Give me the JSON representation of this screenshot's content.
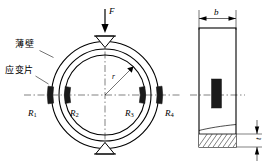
{
  "figure": {
    "stroke_color": "#000000",
    "fill_color": "#1a1a1a",
    "background": "#ffffff"
  },
  "front_view": {
    "force_label": "F",
    "radius_label": "r",
    "thin_wall_label": "薄壁",
    "strain_gauge_label": "应变片",
    "gauges": [
      {
        "id": "R1",
        "label": "R",
        "subscript": "1",
        "position": "outer-left"
      },
      {
        "id": "R2",
        "label": "R",
        "subscript": "2",
        "position": "inner-left"
      },
      {
        "id": "R3",
        "label": "R",
        "subscript": "3",
        "position": "inner-right"
      },
      {
        "id": "R4",
        "label": "R",
        "subscript": "4",
        "position": "outer-right"
      }
    ]
  },
  "side_view": {
    "width_label": "b",
    "thickness_label": "t"
  }
}
